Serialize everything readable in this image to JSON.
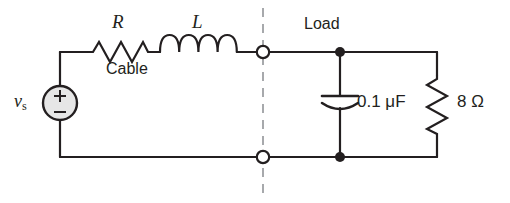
{
  "figure": {
    "name": "ac-circuit-cable-load-schematic",
    "type": "electrical-schematic",
    "background_color": "#ffffff",
    "wire_color": "#231f20",
    "dashed_divider_color": "#a7a9ac",
    "source_fill_color": "#e6e6e6"
  },
  "labels": {
    "source": "v",
    "source_subscript": "s",
    "resistor_cable": "R",
    "inductor_cable": "L",
    "cable_section": "Cable",
    "load_section": "Load",
    "capacitor_value": "0.1 μF",
    "load_resistor_value": "8 Ω"
  },
  "components": [
    {
      "name": "voltage-source",
      "symbol": "circle-with-plus-minus",
      "label": "v_s",
      "polarity_top": "+",
      "polarity_bottom": "−",
      "position": {
        "cx": 60,
        "cy": 103,
        "r": 17
      }
    },
    {
      "name": "cable-resistor",
      "symbol": "zigzag-resistor",
      "label": "R",
      "orientation": "horizontal",
      "position": {
        "x1": 88,
        "y": 52,
        "x2": 150
      }
    },
    {
      "name": "cable-inductor",
      "symbol": "coil-inductor",
      "label": "L",
      "orientation": "horizontal",
      "coils": 4,
      "position": {
        "x1": 160,
        "y": 52,
        "x2": 237
      }
    },
    {
      "name": "load-capacitor",
      "symbol": "capacitor-curved-plate",
      "label": "0.1 μF",
      "orientation": "vertical",
      "position": {
        "x": 340,
        "y1": 52,
        "y2": 157
      }
    },
    {
      "name": "load-resistor",
      "symbol": "zigzag-resistor",
      "label": "8 Ω",
      "orientation": "vertical",
      "position": {
        "x": 437,
        "y1": 75,
        "y2": 135
      }
    }
  ],
  "terminals": [
    {
      "name": "top-open-terminal",
      "style": "open-circle",
      "cx": 263,
      "cy": 52
    },
    {
      "name": "bottom-open-terminal",
      "style": "open-circle",
      "cx": 263,
      "cy": 157
    },
    {
      "name": "top-load-junction",
      "style": "filled-dot",
      "cx": 340,
      "cy": 52
    },
    {
      "name": "bottom-load-junction",
      "style": "filled-dot",
      "cx": 340,
      "cy": 157
    }
  ],
  "divider": {
    "name": "cable-load-boundary",
    "style": "dashed-vertical",
    "x": 263,
    "y1": 8,
    "y2": 195
  }
}
